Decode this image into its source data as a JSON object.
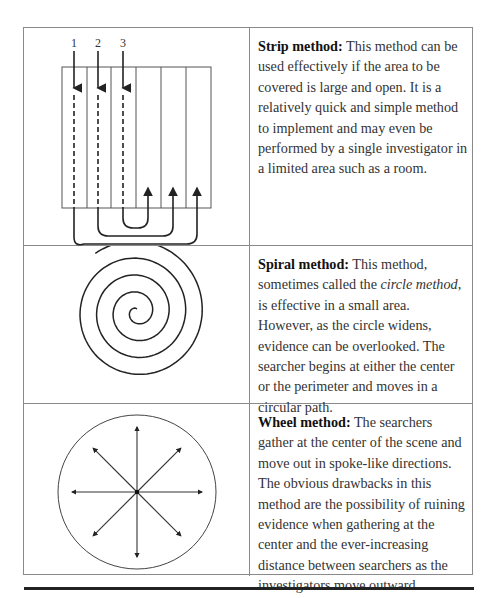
{
  "methods": [
    {
      "title": "Strip method:",
      "body": " This method can be used effectively if the area to be covered is large and open. It is a relatively quick and simple method to implement and may even be performed by a single investigator in a limited area such as a room.",
      "figure": {
        "type": "strip-diagram",
        "labels": [
          "1",
          "2",
          "3"
        ],
        "strips": 6
      }
    },
    {
      "title": "Spiral method:",
      "body_before": " This method, sometimes called the ",
      "body_italic": "circle method",
      "body_after": ", is effective in a small area. However, as the circle widens, evidence can be overlooked. The searcher begins at either the center or the perimeter and moves in a circular path.",
      "figure": {
        "type": "spiral-diagram"
      }
    },
    {
      "title": "Wheel method:",
      "body": " The searchers gather at the center of the scene and move out in spoke-like directions. The obvious drawbacks in this method are the possibility of ruining evidence when gathering at the center and the ever-increasing distance between searchers as the investigators move outward.",
      "figure": {
        "type": "wheel-diagram",
        "spokes": 8
      }
    }
  ],
  "colors": {
    "line": "#222222",
    "border": "#8a8a8a",
    "text": "#333333"
  }
}
